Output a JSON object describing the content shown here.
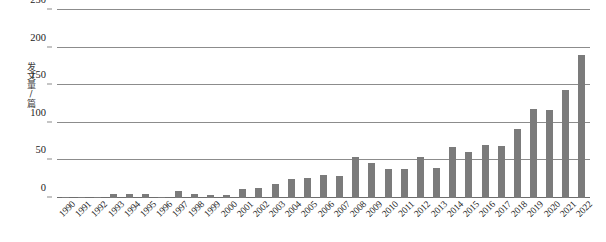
{
  "chart_data": {
    "type": "bar",
    "title": "",
    "xlabel": "",
    "ylabel": "发文量/篇",
    "ylim": [
      0,
      250
    ],
    "ytick_values": [
      0,
      50,
      100,
      150,
      200,
      250
    ],
    "ytick_labels": [
      "0",
      "50",
      "100",
      "150",
      "200",
      "250"
    ],
    "grid": true,
    "legend": "none",
    "bar_color": "#7b7b7b",
    "categories": [
      "1990",
      "1991",
      "1992",
      "1993",
      "1994",
      "1995",
      "1996",
      "1997",
      "1998",
      "1999",
      "2000",
      "2001",
      "2002",
      "2003",
      "2004",
      "2005",
      "2006",
      "2007",
      "2008",
      "2009",
      "2010",
      "2011",
      "2012",
      "2013",
      "2014",
      "2015",
      "2016",
      "2017",
      "2018",
      "2019",
      "2020",
      "2021",
      "2022"
    ],
    "values": [
      2,
      1,
      1,
      5,
      5,
      5,
      1,
      9,
      6,
      4,
      4,
      12,
      13,
      18,
      25,
      26,
      30,
      29,
      55,
      46,
      39,
      39,
      54,
      40,
      68,
      61,
      70,
      69,
      92,
      118,
      117,
      143,
      190
    ],
    "series": [
      {
        "name": "发文量",
        "values": [
          2,
          1,
          1,
          5,
          5,
          5,
          1,
          9,
          6,
          4,
          4,
          12,
          13,
          18,
          25,
          26,
          30,
          29,
          55,
          46,
          39,
          39,
          54,
          40,
          68,
          61,
          70,
          69,
          92,
          118,
          117,
          143,
          190
        ]
      }
    ]
  }
}
